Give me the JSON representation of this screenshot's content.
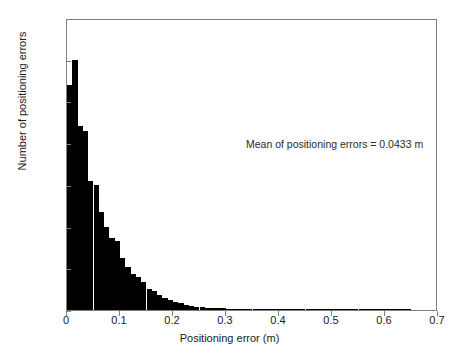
{
  "chart_data": {
    "type": "bar",
    "title": "",
    "subtitle": "",
    "xlabel": "Positioning error (m)",
    "ylabel": "Number of positioning errors",
    "xlim": [
      0,
      0.7
    ],
    "ylim": [
      0,
      3500
    ],
    "grid": false,
    "legend": null,
    "bin_width": 0.01,
    "bar_color": "#000000",
    "frame_color": "#808080",
    "xticks": [
      "0",
      "0.1",
      "0.2",
      "0.3",
      "0.4",
      "0.5",
      "0.6",
      "0.7"
    ],
    "xtick_values": [
      0,
      0.1,
      0.2,
      0.3,
      0.4,
      0.5,
      0.6,
      0.7
    ],
    "yticks": [
      "0",
      "500",
      "1000",
      "1500",
      "2000",
      "2500",
      "3000",
      "3500"
    ],
    "ytick_values": [
      0,
      500,
      1000,
      1500,
      2000,
      2500,
      3000,
      3500
    ],
    "annotations": [
      {
        "text": "Mean of positioning errors = 0.0433 m",
        "x": 0.34,
        "y": 2450
      }
    ],
    "x": [
      0.005,
      0.015,
      0.025,
      0.035,
      0.045,
      0.055,
      0.065,
      0.075,
      0.085,
      0.095,
      0.105,
      0.115,
      0.125,
      0.135,
      0.145,
      0.155,
      0.165,
      0.175,
      0.185,
      0.195,
      0.205,
      0.215,
      0.225,
      0.235,
      0.245,
      0.255,
      0.265,
      0.275,
      0.285,
      0.295,
      0.305,
      0.315,
      0.325,
      0.335,
      0.345,
      0.355,
      0.365,
      0.375,
      0.385,
      0.395,
      0.405,
      0.415,
      0.425,
      0.435,
      0.445,
      0.455,
      0.465,
      0.475,
      0.485,
      0.495,
      0.505,
      0.515,
      0.525,
      0.535,
      0.545,
      0.555,
      0.565,
      0.575,
      0.585,
      0.595,
      0.605,
      0.615,
      0.625,
      0.635,
      0.645,
      0.655,
      0.665,
      0.675,
      0.685,
      0.695
    ],
    "values": [
      2700,
      3000,
      2200,
      2150,
      1550,
      1500,
      1180,
      1000,
      860,
      830,
      620,
      510,
      430,
      400,
      330,
      250,
      230,
      185,
      150,
      125,
      100,
      80,
      62,
      50,
      42,
      35,
      30,
      26,
      22,
      19,
      16,
      14,
      12,
      11,
      9,
      8,
      7,
      7,
      6,
      6,
      5,
      5,
      4,
      4,
      4,
      3,
      3,
      3,
      3,
      2,
      2,
      2,
      2,
      2,
      2,
      1,
      1,
      1,
      1,
      1,
      1,
      1,
      1,
      1,
      1,
      0,
      0,
      0,
      0,
      0
    ]
  }
}
